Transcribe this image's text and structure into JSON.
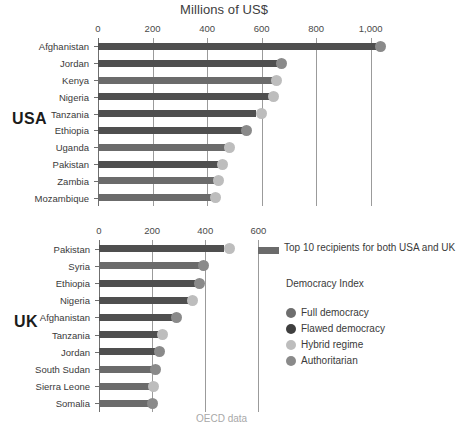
{
  "chart_data": [
    {
      "type": "bar",
      "id": "usa",
      "title": "Millions of US$",
      "group_label": "USA",
      "xlabel": "Millions of US$",
      "ylabel": "",
      "xlim": [
        0,
        1100
      ],
      "ticks": [
        0,
        200,
        400,
        600,
        800,
        1000
      ],
      "tick_labels": [
        "0",
        "200",
        "400",
        "600",
        "800",
        "1,000"
      ],
      "grid": true,
      "categories": [
        "Afghanistan",
        "Jordan",
        "Kenya",
        "Nigeria",
        "Tanzania",
        "Ethiopia",
        "Uganda",
        "Pakistan",
        "Zambia",
        "Mozambique"
      ],
      "values": [
        1020,
        655,
        640,
        630,
        580,
        530,
        465,
        440,
        425,
        415
      ],
      "dot_values": [
        1035,
        672,
        655,
        645,
        598,
        545,
        482,
        458,
        442,
        432
      ],
      "both_top10": [
        true,
        true,
        false,
        true,
        true,
        true,
        false,
        true,
        false,
        false
      ],
      "democracy_index": [
        "Authoritarian",
        "Authoritarian",
        "Hybrid regime",
        "Hybrid regime",
        "Hybrid regime",
        "Authoritarian",
        "Hybrid regime",
        "Hybrid regime",
        "Hybrid regime",
        "Hybrid regime"
      ]
    },
    {
      "type": "bar",
      "id": "uk",
      "title": "",
      "group_label": "UK",
      "xlabel": "",
      "ylabel": "",
      "xlim": [
        0,
        640
      ],
      "ticks": [
        0,
        200,
        400,
        600
      ],
      "tick_labels": [
        "0",
        "200",
        "400",
        "600"
      ],
      "grid": true,
      "categories": [
        "Pakistan",
        "Syria",
        "Ethiopia",
        "Nigeria",
        "Afghanistan",
        "Tanzania",
        "Jordan",
        "South Sudan",
        "Sierra Leone",
        "Somalia"
      ],
      "values": [
        470,
        375,
        360,
        335,
        275,
        222,
        212,
        198,
        192,
        188
      ],
      "dot_values": [
        492,
        392,
        378,
        352,
        292,
        240,
        228,
        213,
        207,
        203
      ],
      "both_top10": [
        true,
        false,
        true,
        true,
        true,
        true,
        true,
        false,
        false,
        false
      ],
      "democracy_index": [
        "Hybrid regime",
        "Authoritarian",
        "Authoritarian",
        "Hybrid regime",
        "Authoritarian",
        "Hybrid regime",
        "Authoritarian",
        "Authoritarian",
        "Hybrid regime",
        "Authoritarian"
      ]
    }
  ],
  "header": {
    "axis_title": "Millions of US$"
  },
  "groups": {
    "usa_label": "USA",
    "uk_label": "UK"
  },
  "legend": {
    "top10_label": "Top 10 recipients for both USA and UK",
    "democracy_title": "Democracy Index",
    "items": [
      {
        "label": "Full democracy",
        "color": "#6e6e6e"
      },
      {
        "label": "Flawed democracy",
        "color": "#3f3f3f"
      },
      {
        "label": "Hybrid regime",
        "color": "#bdbdbd"
      },
      {
        "label": "Authoritarian",
        "color": "#8a8a8a"
      }
    ]
  },
  "source": {
    "text": "OECD data"
  },
  "colors": {
    "bar_both": "#4f4f4f",
    "bar_single": "#6b6b6b",
    "legend_swatch": "#6b6b6b",
    "grid": "#9b9b9b",
    "axis": "#6f6f6f",
    "text": "#3a3a3a",
    "source_text": "#a8a8a8"
  }
}
